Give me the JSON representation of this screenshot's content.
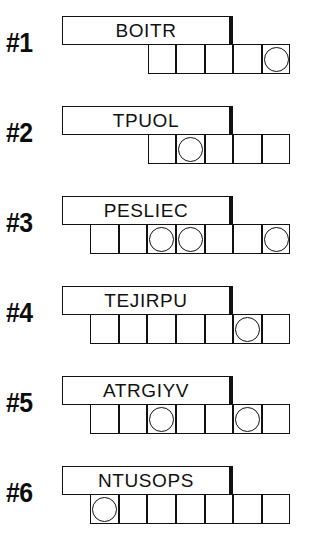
{
  "sheet": {
    "title": "Word Jumble Puzzle Sheet",
    "ink_color": "#111111",
    "background_color": "#ffffff",
    "puzzle_count": 6
  },
  "puzzles": [
    {
      "number_label": "#1",
      "scrambled_word": "BOITR",
      "answer_length": 5,
      "circled_positions": [
        5
      ]
    },
    {
      "number_label": "#2",
      "scrambled_word": "TPUOL",
      "answer_length": 5,
      "circled_positions": [
        2
      ]
    },
    {
      "number_label": "#3",
      "scrambled_word": "PESLIEC",
      "answer_length": 7,
      "circled_positions": [
        3,
        4,
        7
      ]
    },
    {
      "number_label": "#4",
      "scrambled_word": "TEJIRPU",
      "answer_length": 7,
      "circled_positions": [
        6
      ]
    },
    {
      "number_label": "#5",
      "scrambled_word": "ATRGIYV",
      "answer_length": 7,
      "circled_positions": [
        3,
        6
      ]
    },
    {
      "number_label": "#6",
      "scrambled_word": "NTUSOPS",
      "answer_length": 7,
      "circled_positions": [
        1
      ]
    }
  ]
}
